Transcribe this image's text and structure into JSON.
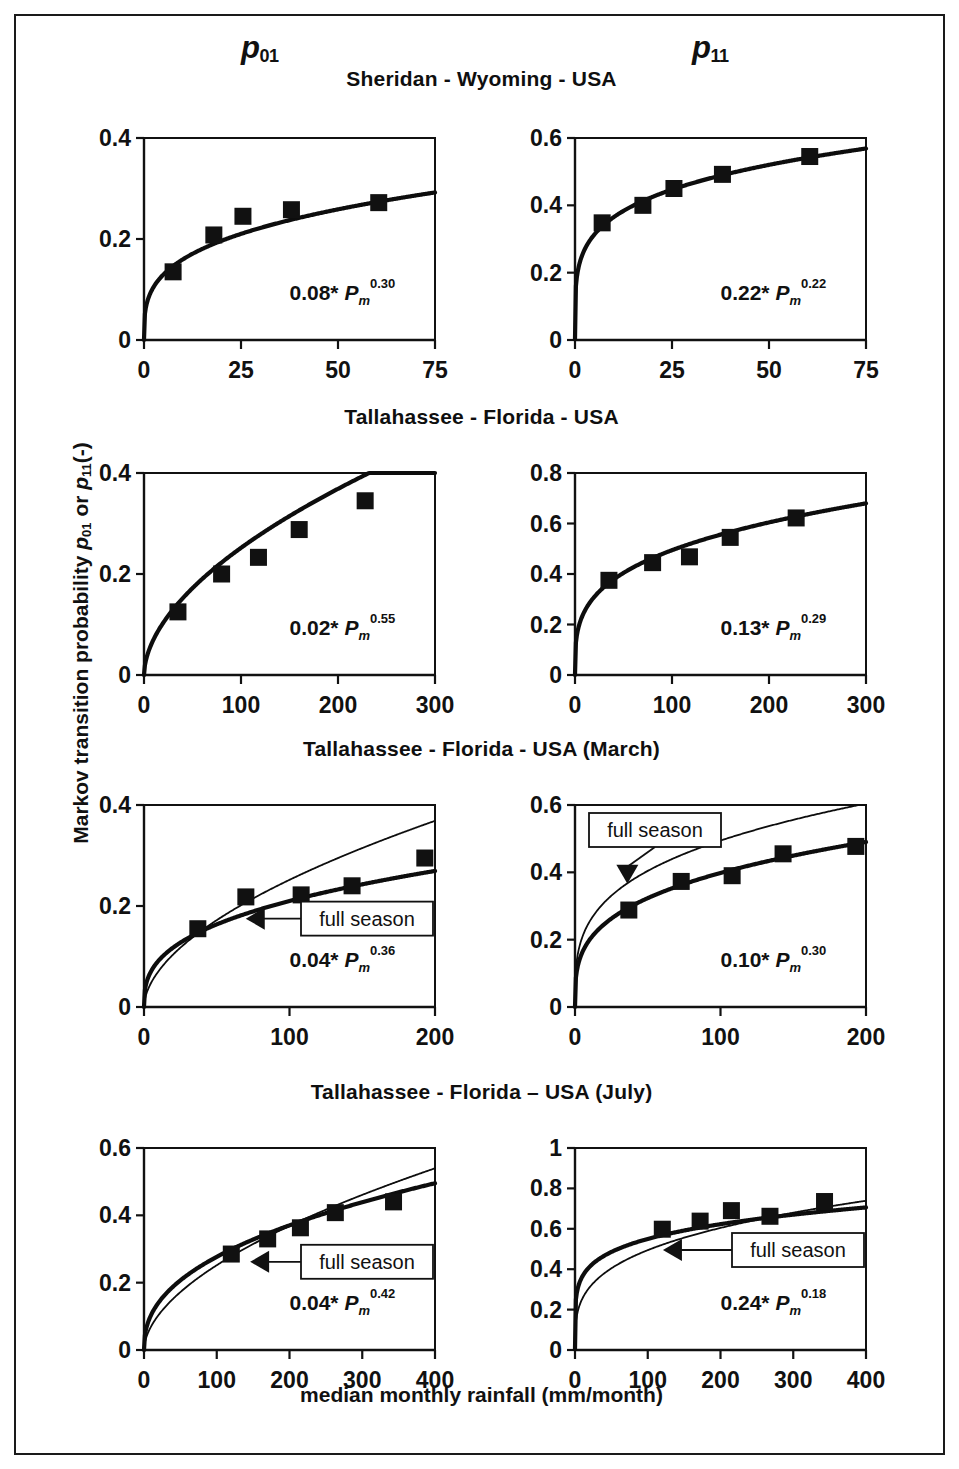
{
  "figure": {
    "column_headers": [
      {
        "base": "p",
        "sub": "01"
      },
      {
        "base": "p",
        "sub": "11"
      }
    ],
    "section_titles": [
      "Sheridan - Wyoming - USA",
      "Tallahassee - Florida - USA",
      "Tallahassee - Florida - USA (March)",
      "Tallahassee - Florida – USA (July)"
    ],
    "y_axis_title_parts": {
      "lead": "Markov transition probability ",
      "var1": "p",
      "sub1": "01",
      "mid": " or ",
      "var2": "p",
      "sub2": "11",
      "tail": "(-)"
    },
    "x_axis_title": "median monthly rainfall (mm/month)",
    "annotation_label": "full season",
    "colors": {
      "ink": "#111111",
      "background": "#ffffff"
    }
  },
  "chart_data": [
    {
      "id": "sheridan-p01",
      "type": "scatter",
      "title": "Sheridan - Wyoming - USA",
      "series_label": "p01",
      "xlabel": "median monthly rainfall (mm/month)",
      "ylabel": "Markov transition probability p01 (-)",
      "xlim": [
        0,
        75
      ],
      "ylim": [
        0,
        0.4
      ],
      "xticks": [
        0,
        25,
        50,
        75
      ],
      "yticks": [
        0,
        0.2,
        0.4
      ],
      "xtick_labels": [
        "0",
        "25",
        "50",
        "75"
      ],
      "ytick_labels": [
        "0",
        "0.2",
        "0.4"
      ],
      "grid": false,
      "points": [
        {
          "x": 7.5,
          "y": 0.135
        },
        {
          "x": 18.0,
          "y": 0.208
        },
        {
          "x": 25.5,
          "y": 0.245
        },
        {
          "x": 38.0,
          "y": 0.258
        },
        {
          "x": 60.5,
          "y": 0.272
        }
      ],
      "fit": {
        "a": 0.08,
        "b": 0.3,
        "label_a": "0.08",
        "label_b": "0.30"
      },
      "full_season": null,
      "annotation": null
    },
    {
      "id": "sheridan-p11",
      "type": "scatter",
      "title": "Sheridan - Wyoming - USA",
      "series_label": "p11",
      "xlabel": "median monthly rainfall (mm/month)",
      "ylabel": "Markov transition probability p11 (-)",
      "xlim": [
        0,
        75
      ],
      "ylim": [
        0,
        0.6
      ],
      "xticks": [
        0,
        25,
        50,
        75
      ],
      "yticks": [
        0,
        0.2,
        0.4,
        0.6
      ],
      "xtick_labels": [
        "0",
        "25",
        "50",
        "75"
      ],
      "ytick_labels": [
        "0",
        "0.2",
        "0.4",
        "0.6"
      ],
      "grid": false,
      "points": [
        {
          "x": 7.0,
          "y": 0.348
        },
        {
          "x": 17.5,
          "y": 0.4
        },
        {
          "x": 25.5,
          "y": 0.45
        },
        {
          "x": 38.0,
          "y": 0.492
        },
        {
          "x": 60.5,
          "y": 0.545
        }
      ],
      "fit": {
        "a": 0.22,
        "b": 0.22,
        "label_a": "0.22",
        "label_b": "0.22"
      },
      "full_season": null,
      "annotation": null
    },
    {
      "id": "tallahassee-p01",
      "type": "scatter",
      "title": "Tallahassee - Florida - USA",
      "series_label": "p01",
      "xlabel": "median monthly rainfall (mm/month)",
      "ylabel": "Markov transition probability p01 (-)",
      "xlim": [
        0,
        300
      ],
      "ylim": [
        0,
        0.4
      ],
      "xticks": [
        0,
        100,
        200,
        300
      ],
      "yticks": [
        0,
        0.2,
        0.4
      ],
      "xtick_labels": [
        "0",
        "100",
        "200",
        "300"
      ],
      "ytick_labels": [
        "0",
        "0.2",
        "0.4"
      ],
      "grid": false,
      "points": [
        {
          "x": 35,
          "y": 0.125
        },
        {
          "x": 80,
          "y": 0.2
        },
        {
          "x": 118,
          "y": 0.233
        },
        {
          "x": 160,
          "y": 0.288
        },
        {
          "x": 228,
          "y": 0.345
        }
      ],
      "fit": {
        "a": 0.02,
        "b": 0.55,
        "label_a": "0.02",
        "label_b": "0.55"
      },
      "full_season": null,
      "annotation": null
    },
    {
      "id": "tallahassee-p11",
      "type": "scatter",
      "title": "Tallahassee - Florida - USA",
      "series_label": "p11",
      "xlabel": "median monthly rainfall (mm/month)",
      "ylabel": "Markov transition probability p11 (-)",
      "xlim": [
        0,
        300
      ],
      "ylim": [
        0,
        0.8
      ],
      "xticks": [
        0,
        100,
        200,
        300
      ],
      "yticks": [
        0,
        0.2,
        0.4,
        0.6,
        0.8
      ],
      "xtick_labels": [
        "0",
        "100",
        "200",
        "300"
      ],
      "ytick_labels": [
        "0",
        "0.2",
        "0.4",
        "0.6",
        "0.8"
      ],
      "grid": false,
      "points": [
        {
          "x": 35,
          "y": 0.375
        },
        {
          "x": 80,
          "y": 0.445
        },
        {
          "x": 118,
          "y": 0.468
        },
        {
          "x": 160,
          "y": 0.545
        },
        {
          "x": 228,
          "y": 0.622
        }
      ],
      "fit": {
        "a": 0.13,
        "b": 0.29,
        "label_a": "0.13",
        "label_b": "0.29"
      },
      "full_season": null,
      "annotation": null
    },
    {
      "id": "tallahassee-march-p01",
      "type": "scatter",
      "title": "Tallahassee - Florida - USA (March)",
      "series_label": "p01",
      "xlabel": "median monthly rainfall (mm/month)",
      "ylabel": "Markov transition probability p01 (-)",
      "xlim": [
        0,
        200
      ],
      "ylim": [
        0,
        0.4
      ],
      "xticks": [
        0,
        100,
        200
      ],
      "yticks": [
        0,
        0.2,
        0.4
      ],
      "xtick_labels": [
        "0",
        "100",
        "200"
      ],
      "ytick_labels": [
        "0",
        "0.2",
        "0.4"
      ],
      "grid": false,
      "points": [
        {
          "x": 37,
          "y": 0.155
        },
        {
          "x": 70,
          "y": 0.218
        },
        {
          "x": 108,
          "y": 0.222
        },
        {
          "x": 143,
          "y": 0.24
        },
        {
          "x": 193,
          "y": 0.295
        }
      ],
      "fit": {
        "a": 0.04,
        "b": 0.36,
        "label_a": "0.04",
        "label_b": "0.36"
      },
      "full_season": {
        "a": 0.02,
        "b": 0.55
      },
      "annotation": {
        "label": "full season",
        "arrow_to_x": 72,
        "arrow_to_y": 0.175
      }
    },
    {
      "id": "tallahassee-march-p11",
      "type": "scatter",
      "title": "Tallahassee - Florida - USA (March)",
      "series_label": "p11",
      "xlabel": "median monthly rainfall (mm/month)",
      "ylabel": "Markov transition probability p11 (-)",
      "xlim": [
        0,
        200
      ],
      "ylim": [
        0,
        0.6
      ],
      "xticks": [
        0,
        100,
        200
      ],
      "yticks": [
        0,
        0.2,
        0.4,
        0.6
      ],
      "xtick_labels": [
        "0",
        "100",
        "200"
      ],
      "ytick_labels": [
        "0",
        "0.2",
        "0.4",
        "0.6"
      ],
      "grid": false,
      "points": [
        {
          "x": 37,
          "y": 0.288
        },
        {
          "x": 73,
          "y": 0.373
        },
        {
          "x": 108,
          "y": 0.39
        },
        {
          "x": 143,
          "y": 0.455
        },
        {
          "x": 193,
          "y": 0.477
        }
      ],
      "fit": {
        "a": 0.1,
        "b": 0.3,
        "label_a": "0.10",
        "label_b": "0.30"
      },
      "full_season": {
        "a": 0.13,
        "b": 0.29
      },
      "annotation": {
        "label": "full season",
        "arrow_to_x": 36,
        "arrow_to_y": 0.375
      }
    },
    {
      "id": "tallahassee-july-p01",
      "type": "scatter",
      "title": "Tallahassee - Florida – USA (July)",
      "series_label": "p01",
      "xlabel": "median monthly rainfall (mm/month)",
      "ylabel": "Markov transition probability p01 (-)",
      "xlim": [
        0,
        400
      ],
      "ylim": [
        0,
        0.6
      ],
      "xticks": [
        0,
        100,
        200,
        300,
        400
      ],
      "yticks": [
        0,
        0.2,
        0.4,
        0.6
      ],
      "xtick_labels": [
        "0",
        "100",
        "200",
        "300",
        "400"
      ],
      "ytick_labels": [
        "0",
        "0.2",
        "0.4",
        "0.6"
      ],
      "grid": false,
      "points": [
        {
          "x": 120,
          "y": 0.285
        },
        {
          "x": 170,
          "y": 0.33
        },
        {
          "x": 215,
          "y": 0.363
        },
        {
          "x": 263,
          "y": 0.408
        },
        {
          "x": 343,
          "y": 0.44
        }
      ],
      "fit": {
        "a": 0.04,
        "b": 0.42,
        "label_a": "0.04",
        "label_b": "0.42"
      },
      "full_season": {
        "a": 0.02,
        "b": 0.55
      },
      "annotation": {
        "label": "full season",
        "arrow_to_x": 150,
        "arrow_to_y": 0.262
      }
    },
    {
      "id": "tallahassee-july-p11",
      "type": "scatter",
      "title": "Tallahassee - Florida – USA (July)",
      "series_label": "p11",
      "xlabel": "median monthly rainfall (mm/month)",
      "ylabel": "Markov transition probability p11 (-)",
      "xlim": [
        0,
        400
      ],
      "ylim": [
        0,
        1.0
      ],
      "xticks": [
        0,
        100,
        200,
        300,
        400
      ],
      "yticks": [
        0,
        0.2,
        0.4,
        0.6,
        0.8,
        1.0
      ],
      "xtick_labels": [
        "0",
        "100",
        "200",
        "300",
        "400"
      ],
      "ytick_labels": [
        "0",
        "0.2",
        "0.4",
        "0.6",
        "0.8",
        "1"
      ],
      "grid": false,
      "points": [
        {
          "x": 120,
          "y": 0.598
        },
        {
          "x": 172,
          "y": 0.638
        },
        {
          "x": 215,
          "y": 0.69
        },
        {
          "x": 268,
          "y": 0.662
        },
        {
          "x": 343,
          "y": 0.735
        }
      ],
      "fit": {
        "a": 0.24,
        "b": 0.18,
        "label_a": "0.24",
        "label_b": "0.18"
      },
      "full_season": {
        "a": 0.13,
        "b": 0.29
      },
      "annotation": {
        "label": "full season",
        "arrow_to_x": 125,
        "arrow_to_y": 0.495
      }
    }
  ],
  "layout": {
    "panels": [
      {
        "id": "sheridan-p01",
        "left": 128,
        "top": 122,
        "pw": 291,
        "ph": 202
      },
      {
        "id": "sheridan-p11",
        "left": 559,
        "top": 122,
        "pw": 291,
        "ph": 202
      },
      {
        "id": "tallahassee-p01",
        "left": 128,
        "top": 457,
        "pw": 291,
        "ph": 202
      },
      {
        "id": "tallahassee-p11",
        "left": 559,
        "top": 457,
        "pw": 291,
        "ph": 202
      },
      {
        "id": "tallahassee-march-p01",
        "left": 128,
        "top": 789,
        "pw": 291,
        "ph": 202
      },
      {
        "id": "tallahassee-march-p11",
        "left": 559,
        "top": 789,
        "pw": 291,
        "ph": 202
      },
      {
        "id": "tallahassee-july-p01",
        "left": 128,
        "top": 1132,
        "pw": 291,
        "ph": 202
      },
      {
        "id": "tallahassee-july-p11",
        "left": 559,
        "top": 1132,
        "pw": 291,
        "ph": 202
      }
    ],
    "section_title_tops": [
      51,
      389,
      721,
      1064
    ]
  }
}
